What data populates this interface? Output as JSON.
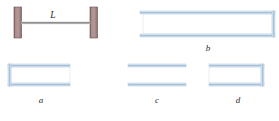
{
  "figure": {
    "background_color": "#ffffff",
    "string_system": {
      "name": "string-fixed-at-both-ends",
      "length_label": "L",
      "wall_color": "#9e7f7f",
      "wall_edge_color": "#6e5050",
      "string_color": "#8c8c8c",
      "left_wall": {
        "x": 14,
        "y": 7,
        "width": 7,
        "height": 31
      },
      "right_wall": {
        "x": 90,
        "y": 7,
        "width": 7,
        "height": 31
      },
      "string": {
        "x1": 21,
        "y1": 23,
        "x2": 90,
        "y2": 23
      }
    },
    "tube_color": "#b9cfe3",
    "tube_fill": "#dce8f3",
    "tubes": [
      {
        "id": "a",
        "label": "a",
        "open_side": "right",
        "description": "tube closed at left end, open at right end",
        "x": 8,
        "y": 64,
        "width": 62,
        "height": 22,
        "label_x": 41,
        "label_y": 103
      },
      {
        "id": "b",
        "label": "b",
        "open_side": "left",
        "description": "long tube open at left end, closed at right end",
        "x": 140,
        "y": 11,
        "width": 135,
        "height": 26,
        "label_x": 208,
        "label_y": 51
      },
      {
        "id": "c",
        "label": "c",
        "open_side": "both",
        "description": "tube open at both ends",
        "x": 128,
        "y": 64,
        "width": 58,
        "height": 22,
        "label_x": 157,
        "label_y": 103
      },
      {
        "id": "d",
        "label": "d",
        "open_side": "left",
        "description": "tube open at left end, closed at right end",
        "x": 209,
        "y": 64,
        "width": 55,
        "height": 22,
        "label_x": 238,
        "label_y": 103
      }
    ]
  }
}
